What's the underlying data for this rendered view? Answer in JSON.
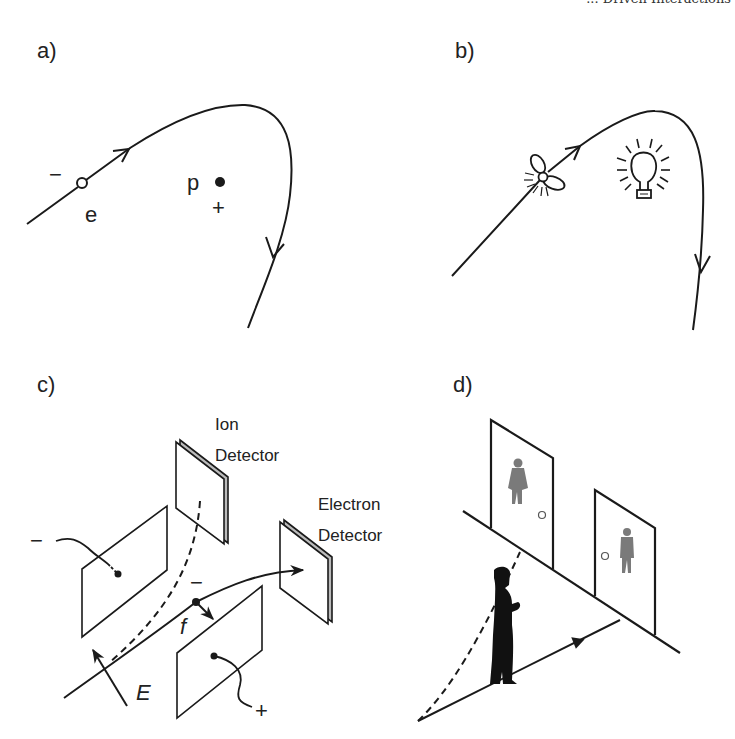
{
  "header_fragment": "... Driven Interactions",
  "panels": {
    "a": {
      "label": "a)",
      "electron_charge": "−",
      "electron_label": "e",
      "proton_label": "p",
      "proton_charge": "+"
    },
    "b": {
      "label": "b)",
      "icons": [
        "propeller-icon",
        "lightbulb-icon"
      ]
    },
    "c": {
      "label": "c)",
      "ion_detector_line1": "Ion",
      "ion_detector_line2": "Detector",
      "electron_detector_line1": "Electron",
      "electron_detector_line2": "Detector",
      "neg_plate_sign": "−",
      "pos_plate_sign": "+",
      "particle_charge": "−",
      "force_label": "f",
      "field_label": "E"
    },
    "d": {
      "label": "d)",
      "icons": [
        "woman-restroom-icon",
        "man-restroom-icon",
        "person-silhouette-icon"
      ]
    }
  },
  "colors": {
    "ink": "#1a1a1a",
    "gray_icon": "#7a7a7a"
  }
}
